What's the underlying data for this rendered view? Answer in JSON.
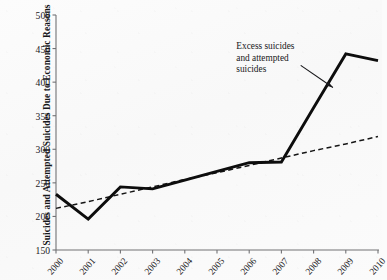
{
  "chart_data": {
    "type": "line",
    "title": "",
    "xlabel": "",
    "ylabel": "Suicides and Attempted Suicides Due to Economic Reasons",
    "x": [
      2000,
      2001,
      2002,
      2003,
      2004,
      2005,
      2006,
      2007,
      2008,
      2009,
      2010
    ],
    "xtick_labels": [
      "2000",
      "2001",
      "2002",
      "2003",
      "2004",
      "2005",
      "2006",
      "2007",
      "2008",
      "2009",
      "2010"
    ],
    "ytick_labels": [
      "500",
      "450",
      "400",
      "350",
      "300",
      "250",
      "200",
      "150"
    ],
    "yticks": [
      500,
      450,
      400,
      350,
      300,
      250,
      200,
      150
    ],
    "ylim": [
      150,
      500
    ],
    "xlim": [
      2000,
      2010
    ],
    "grid": false,
    "legend": "none",
    "series": [
      {
        "name": "Suicides and attempted suicides",
        "style": "solid",
        "color": "#0d0d0d",
        "values": [
          233,
          196,
          244,
          241,
          254,
          267,
          280,
          281,
          362,
          442,
          432
        ]
      },
      {
        "name": "Trend line",
        "style": "dashed",
        "color": "#151515",
        "values": [
          212,
          222,
          233,
          244,
          255,
          265,
          276,
          287,
          298,
          308,
          319
        ]
      }
    ],
    "annotations": [
      {
        "name": "excess-suicides-note",
        "lines": [
          "Excess suicides",
          "and attempted",
          "suicides"
        ],
        "x": 2005.6,
        "y": 452,
        "arrow": {
          "from_x": 2007.6,
          "from_y": 425,
          "to_x": 2008.6,
          "to_y": 392
        }
      }
    ]
  },
  "colors": {
    "background": "#fbfbfb",
    "axis": "#6f6f72",
    "ink": "#17171a",
    "series_solid": "#0d0d0d",
    "series_dashed": "#151515"
  }
}
